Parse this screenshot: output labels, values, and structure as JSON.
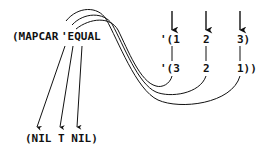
{
  "expression": {
    "head": "(MAPCAR",
    "function": "'EQUAL"
  },
  "list1": {
    "items": [
      "'(1",
      "2",
      "3)"
    ]
  },
  "list2": {
    "items": [
      "'(3",
      "2",
      "1))"
    ]
  },
  "result": {
    "text": "(NIL T NIL)"
  },
  "colors": {
    "ink": "#111111",
    "background": "#ffffff"
  }
}
